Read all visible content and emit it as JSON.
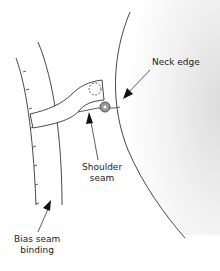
{
  "labels": {
    "neck_edge": "Neck edge",
    "shoulder_seam_line1": "Shoulder",
    "shoulder_seam_line2": "seam",
    "bias_line1": "Bias seam",
    "bias_line2": "binding"
  },
  "colors": {
    "line": "#333333",
    "shade": "#e6e6e6",
    "background": "#ffffff"
  }
}
